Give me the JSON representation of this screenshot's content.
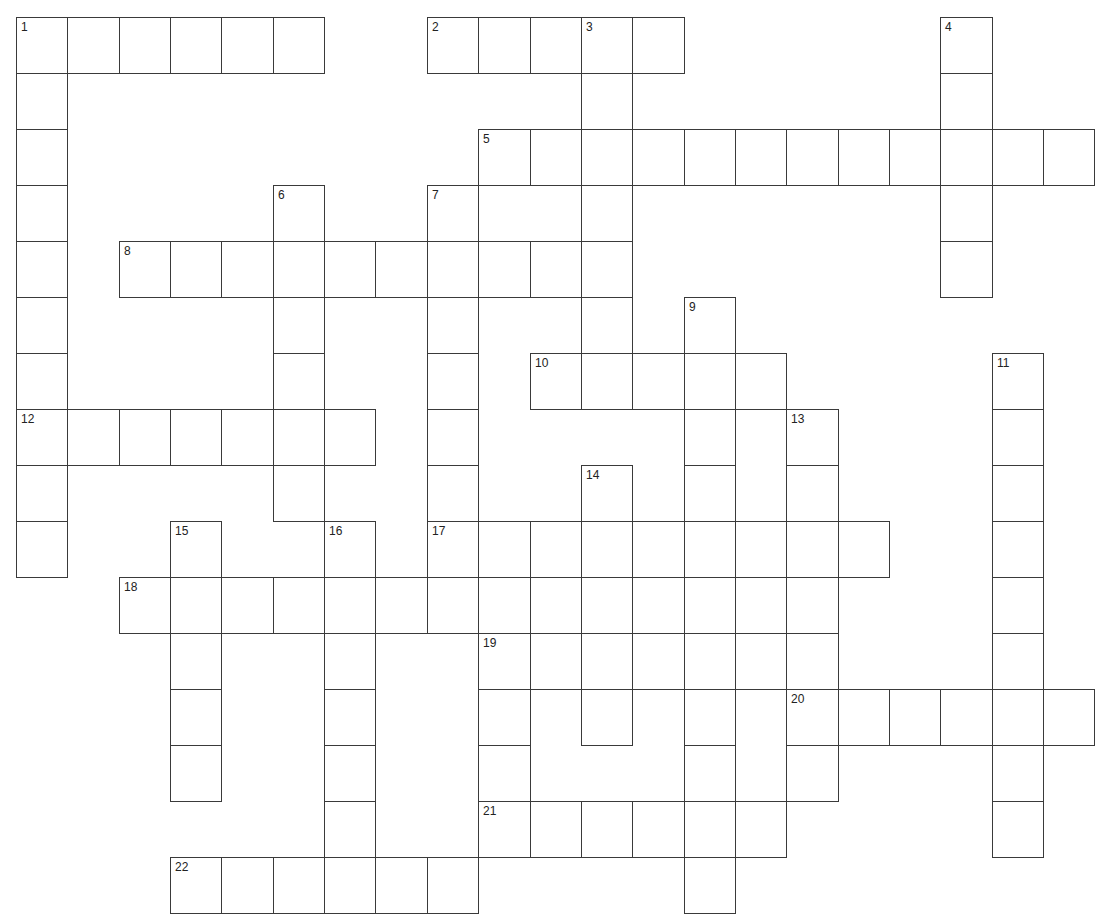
{
  "puzzle": {
    "grid": {
      "origin_x": 16,
      "origin_y": 17,
      "cell_w": 51.35,
      "cell_h": 56.0,
      "border_color": "#3a3a3a",
      "background": "#ffffff"
    },
    "entries": [
      {
        "number": "1",
        "direction": "across",
        "row": 0,
        "col": 0,
        "length": 6
      },
      {
        "number": "1",
        "direction": "down",
        "row": 0,
        "col": 0,
        "length": 10
      },
      {
        "number": "2",
        "direction": "across",
        "row": 0,
        "col": 8,
        "length": 5
      },
      {
        "number": "3",
        "direction": "down",
        "row": 0,
        "col": 11,
        "length": 6
      },
      {
        "number": "4",
        "direction": "down",
        "row": 0,
        "col": 18,
        "length": 5
      },
      {
        "number": "5",
        "direction": "across",
        "row": 2,
        "col": 9,
        "length": 12
      },
      {
        "number": "6",
        "direction": "down",
        "row": 3,
        "col": 5,
        "length": 6
      },
      {
        "number": "7",
        "direction": "down",
        "row": 3,
        "col": 8,
        "length": 8
      },
      {
        "number": "8",
        "direction": "across",
        "row": 4,
        "col": 2,
        "length": 10
      },
      {
        "number": "9",
        "direction": "down",
        "row": 5,
        "col": 13,
        "length": 11
      },
      {
        "number": "10",
        "direction": "across",
        "row": 6,
        "col": 10,
        "length": 5
      },
      {
        "number": "11",
        "direction": "down",
        "row": 6,
        "col": 19,
        "length": 9
      },
      {
        "number": "12",
        "direction": "across",
        "row": 7,
        "col": 0,
        "length": 7
      },
      {
        "number": "13",
        "direction": "down",
        "row": 7,
        "col": 15,
        "length": 7
      },
      {
        "number": "14",
        "direction": "down",
        "row": 8,
        "col": 11,
        "length": 5
      },
      {
        "number": "15",
        "direction": "down",
        "row": 9,
        "col": 3,
        "length": 5
      },
      {
        "number": "16",
        "direction": "down",
        "row": 9,
        "col": 6,
        "length": 7
      },
      {
        "number": "17",
        "direction": "across",
        "row": 9,
        "col": 8,
        "length": 9
      },
      {
        "number": "18",
        "direction": "across",
        "row": 10,
        "col": 2,
        "length": 14
      },
      {
        "number": "19",
        "direction": "across",
        "row": 11,
        "col": 9,
        "length": 7
      },
      {
        "number": "19",
        "direction": "down",
        "row": 11,
        "col": 9,
        "length": 4
      },
      {
        "number": "20",
        "direction": "across",
        "row": 12,
        "col": 15,
        "length": 6
      },
      {
        "number": "21",
        "direction": "across",
        "row": 14,
        "col": 9,
        "length": 6
      },
      {
        "number": "22",
        "direction": "across",
        "row": 15,
        "col": 3,
        "length": 6
      }
    ]
  }
}
